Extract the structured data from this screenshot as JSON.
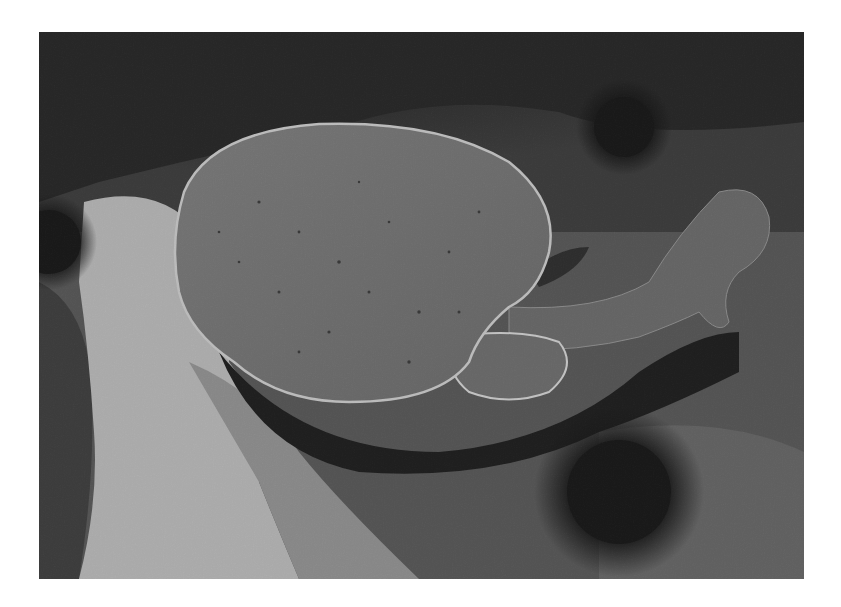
{
  "photo": {
    "subject": "electric ray resting on rocky seabed",
    "palette": {
      "background": "#ffffff",
      "dark_rock": "#1a1a1a",
      "rock": "#4a4a4a",
      "sand": "#b8b8b8",
      "ray_body": "#6a6a6a",
      "ray_edge": "#c8c8c8",
      "shadow": "#0a0a0a",
      "urchin": "#050505"
    },
    "elements": [
      {
        "name": "electric-ray",
        "kind": "animal"
      },
      {
        "name": "sea-urchin-top-right",
        "kind": "animal"
      },
      {
        "name": "sea-urchin-bottom-center",
        "kind": "animal"
      },
      {
        "name": "sea-urchin-left-edge",
        "kind": "animal"
      },
      {
        "name": "sand-patch",
        "kind": "terrain"
      },
      {
        "name": "rocky-seabed",
        "kind": "terrain"
      }
    ]
  }
}
